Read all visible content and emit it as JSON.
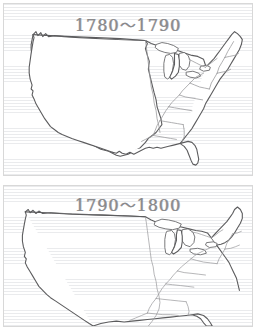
{
  "page": {
    "background_color": "#ffffff",
    "paper_rule_color": "#969ba5",
    "panel_border_color": "#d8d8d8"
  },
  "panels": [
    {
      "id": "panel-1780-1790",
      "title": "1780～1790",
      "title_color": "#8a8a8c",
      "map": {
        "name": "united-states-outline-map",
        "coastline_color": "#5c5c5e",
        "state_border_color": "#9a9a9c",
        "features": [
          "west-coast",
          "great-lakes",
          "florida-peninsula",
          "gulf-coast",
          "new-england",
          "eastern-state-boundaries"
        ]
      }
    },
    {
      "id": "panel-1790-1800",
      "title": "1790～1800",
      "title_color": "#8a8a8c",
      "map": {
        "name": "united-states-outline-map",
        "coastline_color": "#5c5c5e",
        "state_border_color": "#9a9a9c",
        "features": [
          "west-coast",
          "great-lakes",
          "florida-peninsula",
          "gulf-coast",
          "new-england",
          "eastern-state-boundaries"
        ]
      }
    }
  ]
}
